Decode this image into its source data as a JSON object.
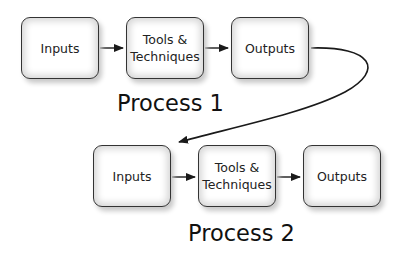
{
  "process1": {
    "label": "Process 1",
    "boxes": [
      "Inputs",
      "Tools & Techniques",
      "Outputs"
    ]
  },
  "process2": {
    "label": "Process 2",
    "boxes": [
      "Inputs",
      "Tools & Techniques",
      "Outputs"
    ]
  },
  "colors": {
    "stroke": "#1a1a1a",
    "box_shadow": "#d6d6d6"
  }
}
